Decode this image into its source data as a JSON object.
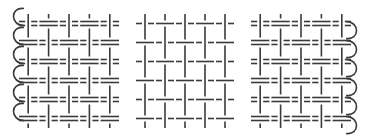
{
  "figure": {
    "stroke_color": "#3a3a3a",
    "background": "#ffffff",
    "panels": [
      {
        "id": "left",
        "name": "panel-left-doubled-weave",
        "weft": "double",
        "warp_cols": 5,
        "weft_rows": 6,
        "selvedge_loops": "left"
      },
      {
        "id": "middle",
        "name": "panel-middle-single-weave",
        "weft": "single",
        "warp_cols": 5,
        "weft_rows": 6,
        "selvedge_loops": "none"
      },
      {
        "id": "right",
        "name": "panel-right-doubled-weave",
        "weft": "double",
        "warp_cols": 5,
        "weft_rows": 6,
        "selvedge_loops": "right"
      }
    ]
  }
}
